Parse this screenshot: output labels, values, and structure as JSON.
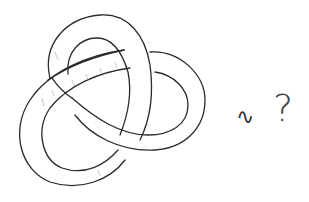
{
  "diagram": {
    "type": "knot-sketch",
    "relation_symbol": "∿",
    "question_symbol": "?",
    "colors": {
      "stroke": "#2a2a2a",
      "background": "#ffffff",
      "hatching": "#b8b8b8"
    }
  }
}
